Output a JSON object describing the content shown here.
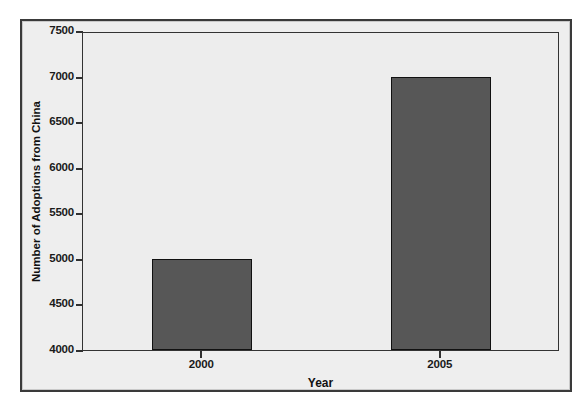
{
  "chart_data": {
    "type": "bar",
    "title": "",
    "subtitle": "",
    "categories": [
      "2000",
      "2005"
    ],
    "values": [
      5000,
      7000
    ],
    "series": [
      {
        "name": "Number of Adoptions from China",
        "values": [
          5000,
          7000
        ]
      }
    ],
    "xlabel": "Year",
    "ylabel": "Number of Adoptions from China",
    "ylim": [
      4000,
      7500
    ],
    "ytick_values": [
      4000,
      4500,
      5000,
      5500,
      6000,
      6500,
      7000,
      7500
    ],
    "ytick_labels": [
      "4000",
      "4500",
      "5000",
      "5500",
      "6000",
      "6500",
      "7000",
      "7500"
    ],
    "xtick_labels": [
      "2000",
      "2005"
    ],
    "grid": false,
    "legend": false,
    "legend_position": "none",
    "annotations": []
  },
  "axes": {
    "y_title": "Number of Adoptions from China",
    "x_title": "Year",
    "y_ticks": [
      {
        "label": "7500",
        "value": 7500
      },
      {
        "label": "7000",
        "value": 7000
      },
      {
        "label": "6500",
        "value": 6500
      },
      {
        "label": "6000",
        "value": 6000
      },
      {
        "label": "5500",
        "value": 5500
      },
      {
        "label": "5000",
        "value": 5000
      },
      {
        "label": "4500",
        "value": 4500
      },
      {
        "label": "4000",
        "value": 4000
      }
    ],
    "x_ticks": [
      {
        "label": "2000",
        "value": 5000
      },
      {
        "label": "2005",
        "value": 7000
      }
    ]
  },
  "style": {
    "bar_fill": "#575757",
    "bar_edge": "#111111",
    "plot_background": "#ededed",
    "figure_background": "#eeeeee",
    "page_background": "#ffffff",
    "axis_color": "#333333",
    "text_color": "#111111"
  }
}
